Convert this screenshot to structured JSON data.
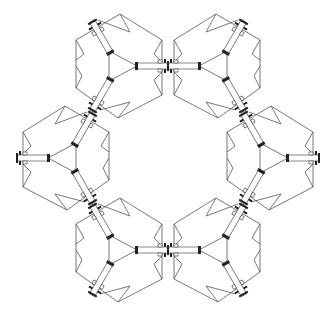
{
  "figure": {
    "module_count": 6,
    "modules": [
      {
        "id": "top-left",
        "cx": 118,
        "cy": 66,
        "mirror": false
      },
      {
        "id": "top-right",
        "cx": 218,
        "cy": 66,
        "mirror": true
      },
      {
        "id": "left",
        "cx": 67,
        "cy": 158,
        "mirror": true
      },
      {
        "id": "right",
        "cx": 269,
        "cy": 158,
        "mirror": false
      },
      {
        "id": "bottom-left",
        "cx": 118,
        "cy": 250,
        "mirror": false
      },
      {
        "id": "bottom-right",
        "cx": 218,
        "cy": 250,
        "mirror": true
      }
    ],
    "colors": {
      "background": "#ffffff",
      "line": "#555555",
      "clamp": "#222222"
    }
  }
}
